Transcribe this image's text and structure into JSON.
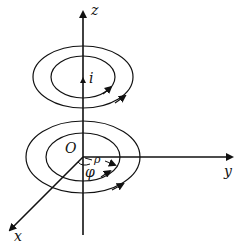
{
  "diagram": {
    "type": "cylindrical-coordinates-magnetic-field",
    "labels": {
      "z_axis": "z",
      "y_axis": "y",
      "x_axis": "x",
      "origin": "O",
      "current": "i",
      "rho": "ρ",
      "phi": "φ"
    },
    "colors": {
      "stroke": "#111111",
      "background": "#ffffff"
    },
    "field_loops": [
      {
        "name": "upper-outer",
        "cx": 83,
        "cy": 77,
        "rx": 50,
        "ry": 31
      },
      {
        "name": "upper-inner",
        "cx": 83,
        "cy": 77,
        "rx": 32,
        "ry": 21
      },
      {
        "name": "lower-outer",
        "cx": 83,
        "cy": 157,
        "rx": 57,
        "ry": 36
      },
      {
        "name": "lower-inner",
        "cx": 83,
        "cy": 157,
        "rx": 37,
        "ry": 24
      }
    ]
  }
}
